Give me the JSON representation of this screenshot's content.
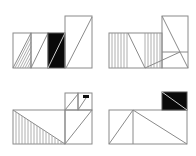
{
  "figure": {
    "stroke_color": "#8a8a8a",
    "fill_color": "#0a0a0a",
    "background": "#ffffff"
  },
  "panels": [
    {
      "id": "top-left",
      "label": "Four adjacent rectangles, hatched, diagonal, black, tall"
    },
    {
      "id": "top-right",
      "label": "Rectangle with vertical hatching and zigzag diagonals plus tall rectangle"
    },
    {
      "id": "bottom-left",
      "label": "Rectangle with hatched triangle and two small boxes above"
    },
    {
      "id": "bottom-right",
      "label": "Rectangle with triangles and black box above"
    }
  ]
}
